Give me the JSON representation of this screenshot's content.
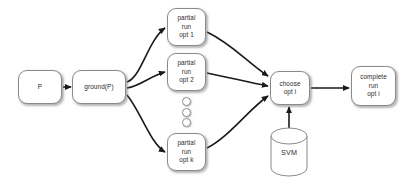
{
  "diagram": {
    "background_color": "#ffffff",
    "node_stroke_color": "#8a8a8a",
    "edge_color": "#1a1a1a",
    "text_color": "#2b2b2b",
    "nodes": [
      {
        "id": "p",
        "shape": "rounded-rect",
        "lines": [
          "P"
        ],
        "x": 18,
        "y": 70,
        "w": 44,
        "h": 34
      },
      {
        "id": "ground-p",
        "shape": "rounded-rect",
        "lines": [
          "ground(P)"
        ],
        "x": 72,
        "y": 70,
        "w": 54,
        "h": 34
      },
      {
        "id": "partial-run-opt-1",
        "shape": "rounded-rect",
        "lines": [
          "partial",
          "run",
          "opt 1"
        ],
        "x": 167,
        "y": 8,
        "w": 39,
        "h": 38
      },
      {
        "id": "partial-run-opt-2",
        "shape": "rounded-rect",
        "lines": [
          "partial",
          "run",
          "opt 2"
        ],
        "x": 167,
        "y": 53,
        "w": 39,
        "h": 38
      },
      {
        "id": "partial-run-opt-k",
        "shape": "rounded-rect",
        "lines": [
          "partial",
          "run",
          "opt k"
        ],
        "x": 167,
        "y": 133,
        "w": 39,
        "h": 38
      },
      {
        "id": "choose-opt-i",
        "shape": "rounded-rect",
        "lines": [
          "choose",
          "opt i"
        ],
        "x": 270,
        "y": 71,
        "w": 40,
        "h": 34
      },
      {
        "id": "complete-run-opt-i",
        "shape": "rounded-rect",
        "lines": [
          "complete",
          "run",
          "opt i"
        ],
        "x": 351,
        "y": 66,
        "w": 45,
        "h": 40
      }
    ],
    "database": {
      "id": "svm",
      "shape": "cylinder",
      "label": "SVM",
      "x": 270,
      "y": 127,
      "w": 38,
      "h": 50
    },
    "ellipsis": {
      "id": "vertical-ellipsis",
      "glyph": "three-circles",
      "count": 3,
      "x": 182,
      "y": 97,
      "w": 9,
      "h": 30
    },
    "edges": [
      {
        "id": "p-to-ground",
        "from": "P",
        "to": "ground(P)",
        "style": "straight-arrow"
      },
      {
        "id": "ground-to-opt1",
        "from": "ground(P)",
        "to": "partial run opt 1",
        "style": "curved-arrow"
      },
      {
        "id": "ground-to-opt2",
        "from": "ground(P)",
        "to": "partial run opt 2",
        "style": "curved-arrow"
      },
      {
        "id": "ground-to-optk",
        "from": "ground(P)",
        "to": "partial run opt k",
        "style": "curved-arrow"
      },
      {
        "id": "opt1-to-choose",
        "from": "partial run opt 1",
        "to": "choose opt i",
        "style": "curved-arrow"
      },
      {
        "id": "opt2-to-choose",
        "from": "partial run opt 2",
        "to": "choose opt i",
        "style": "curved-arrow"
      },
      {
        "id": "optk-to-choose",
        "from": "partial run opt k",
        "to": "choose opt i",
        "style": "curved-arrow"
      },
      {
        "id": "svm-to-choose",
        "from": "SVM",
        "to": "choose opt i",
        "style": "straight-arrow"
      },
      {
        "id": "choose-to-complete",
        "from": "choose opt i",
        "to": "complete run opt i",
        "style": "straight-arrow"
      }
    ]
  }
}
